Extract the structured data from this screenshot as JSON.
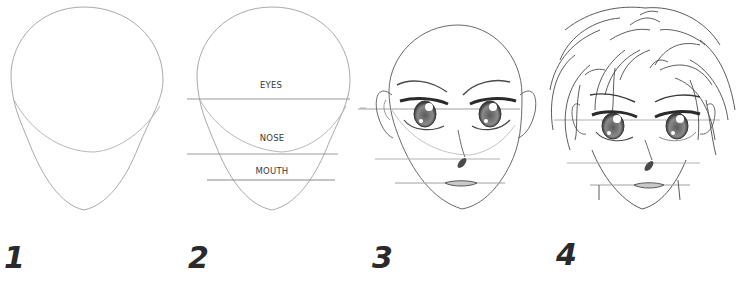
{
  "steps": [
    {
      "number": "1",
      "description": "Head outline with jaw guide"
    },
    {
      "number": "2",
      "description": "Guide lines for features"
    },
    {
      "number": "3",
      "description": "Eyes, brows, nose, mouth, ears"
    },
    {
      "number": "4",
      "description": "Add hair and neck"
    }
  ],
  "guide_labels": {
    "eyes": "EYES",
    "nose": "NOSE",
    "mouth": "MOUTH"
  },
  "colors": {
    "background": "#ffffff",
    "pencil_light": "#b8b8b8",
    "pencil_dark": "#4a4a4a",
    "number_ink": "#2a2a2a"
  }
}
